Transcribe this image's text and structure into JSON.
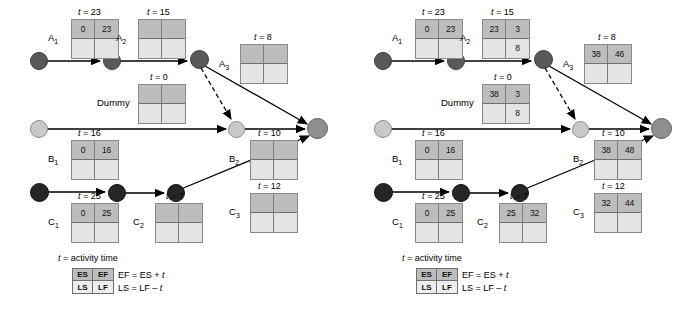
{
  "figure": {
    "type": "project-network-diagram",
    "panels": [
      {
        "id": "left",
        "caption": "",
        "nodes": [
          {
            "name": "node-a-start",
            "shade": "dark",
            "x": 30,
            "y": 52,
            "d": 18
          },
          {
            "name": "node-a-1",
            "shade": "dark",
            "x": 103,
            "y": 52,
            "d": 18
          },
          {
            "name": "node-a-2",
            "shade": "dark",
            "x": 190,
            "y": 50,
            "d": 19
          },
          {
            "name": "node-b-start",
            "shade": "light",
            "x": 30,
            "y": 120,
            "d": 18
          },
          {
            "name": "node-b-1",
            "shade": "light",
            "x": 228,
            "y": 121,
            "d": 17
          },
          {
            "name": "node-c-start",
            "shade": "black",
            "x": 30,
            "y": 183,
            "d": 19
          },
          {
            "name": "node-c-1",
            "shade": "black",
            "x": 108,
            "y": 184,
            "d": 18
          },
          {
            "name": "node-c-2",
            "shade": "black",
            "x": 167,
            "y": 184,
            "d": 18
          },
          {
            "name": "node-finish",
            "shade": "mid",
            "x": 307,
            "y": 118,
            "d": 21
          }
        ],
        "activities": [
          {
            "name": "activity-a1",
            "label": "A",
            "sub": "1",
            "t_prefix": "t =",
            "t": "23",
            "box": {
              "x": 71,
              "y": 19,
              "w": 48,
              "h": 40
            },
            "t_pos": {
              "x": 78,
              "y": 7
            },
            "label_pos": {
              "x": 48,
              "y": 32
            },
            "cells": [
              "0",
              "23",
              "",
              ""
            ]
          },
          {
            "name": "activity-a2",
            "label": "A",
            "sub": "2",
            "t_prefix": "t =",
            "t": "15",
            "box": {
              "x": 138,
              "y": 19,
              "w": 48,
              "h": 40
            },
            "t_pos": {
              "x": 147,
              "y": 7
            },
            "label_pos": {
              "x": 116,
              "y": 32
            },
            "cells": [
              "",
              "",
              "",
              ""
            ]
          },
          {
            "name": "activity-a3",
            "label": "A",
            "sub": "3",
            "t_prefix": "t =",
            "t": "8",
            "box": {
              "x": 240,
              "y": 44,
              "w": 48,
              "h": 40
            },
            "t_pos": {
              "x": 254,
              "y": 32
            },
            "label_pos": {
              "x": 219,
              "y": 58
            },
            "cells": [
              "",
              "",
              "",
              ""
            ]
          },
          {
            "name": "activity-dummy",
            "label": "Dummy",
            "sub": "",
            "t_prefix": "t =",
            "t": "0",
            "box": {
              "x": 138,
              "y": 84,
              "w": 48,
              "h": 40
            },
            "t_pos": {
              "x": 150,
              "y": 72
            },
            "label_pos": {
              "x": 97,
              "y": 97
            },
            "cells": [
              "",
              "",
              "",
              ""
            ]
          },
          {
            "name": "activity-b1",
            "label": "B",
            "sub": "1",
            "t_prefix": "t =",
            "t": "16",
            "box": {
              "x": 71,
              "y": 140,
              "w": 48,
              "h": 40
            },
            "t_pos": {
              "x": 78,
              "y": 128
            },
            "label_pos": {
              "x": 48,
              "y": 153
            },
            "cells": [
              "0",
              "16",
              "",
              ""
            ]
          },
          {
            "name": "activity-b2",
            "label": "B",
            "sub": "2",
            "t_prefix": "t =",
            "t": "10",
            "box": {
              "x": 250,
              "y": 140,
              "w": 48,
              "h": 40
            },
            "t_pos": {
              "x": 258,
              "y": 128
            },
            "label_pos": {
              "x": 229,
              "y": 153
            },
            "cells": [
              "",
              "",
              "",
              ""
            ]
          },
          {
            "name": "activity-c1",
            "label": "C",
            "sub": "1",
            "t_prefix": "t =",
            "t": "25",
            "box": {
              "x": 71,
              "y": 203,
              "w": 48,
              "h": 40
            },
            "t_pos": {
              "x": 78,
              "y": 191
            },
            "label_pos": {
              "x": 48,
              "y": 216
            },
            "cells": [
              "0",
              "25",
              "",
              ""
            ]
          },
          {
            "name": "activity-c2",
            "label": "C",
            "sub": "2",
            "t_prefix": "t =",
            "t": "7",
            "box": {
              "x": 155,
              "y": 203,
              "w": 48,
              "h": 40
            },
            "t_pos": {
              "x": 166,
              "y": 191
            },
            "label_pos": {
              "x": 133,
              "y": 216
            },
            "cells": [
              "",
              "",
              "",
              ""
            ]
          },
          {
            "name": "activity-c3",
            "label": "C",
            "sub": "3",
            "t_prefix": "t =",
            "t": "12",
            "box": {
              "x": 250,
              "y": 193,
              "w": 48,
              "h": 40
            },
            "t_pos": {
              "x": 258,
              "y": 181
            },
            "label_pos": {
              "x": 229,
              "y": 206
            },
            "cells": [
              "",
              "",
              "",
              ""
            ]
          }
        ],
        "legend": {
          "x": 58,
          "y": 253,
          "title_prefix": "t",
          "title_rest": "= activity time",
          "cells": [
            "ES",
            "EF",
            "LS",
            "LF"
          ],
          "eq_top": "EF = ES +",
          "eq_top_var": "t",
          "eq_bottom": "LS = LF –",
          "eq_bottom_var": "t"
        }
      },
      {
        "id": "right",
        "caption": "",
        "nodes": [
          {
            "name": "node-a-start",
            "shade": "dark",
            "x": 30,
            "y": 52,
            "d": 18
          },
          {
            "name": "node-a-1",
            "shade": "dark",
            "x": 103,
            "y": 52,
            "d": 18
          },
          {
            "name": "node-a-2",
            "shade": "dark",
            "x": 190,
            "y": 50,
            "d": 19
          },
          {
            "name": "node-b-start",
            "shade": "light",
            "x": 30,
            "y": 120,
            "d": 18
          },
          {
            "name": "node-b-1",
            "shade": "light",
            "x": 228,
            "y": 121,
            "d": 17
          },
          {
            "name": "node-c-start",
            "shade": "black",
            "x": 30,
            "y": 183,
            "d": 19
          },
          {
            "name": "node-c-1",
            "shade": "black",
            "x": 108,
            "y": 184,
            "d": 18
          },
          {
            "name": "node-c-2",
            "shade": "black",
            "x": 167,
            "y": 184,
            "d": 18
          },
          {
            "name": "node-finish",
            "shade": "mid",
            "x": 307,
            "y": 118,
            "d": 21
          }
        ],
        "activities": [
          {
            "name": "activity-a1",
            "label": "A",
            "sub": "1",
            "t_prefix": "t =",
            "t": "23",
            "box": {
              "x": 71,
              "y": 19,
              "w": 48,
              "h": 40
            },
            "t_pos": {
              "x": 78,
              "y": 7
            },
            "label_pos": {
              "x": 48,
              "y": 32
            },
            "cells": [
              "0",
              "23",
              "",
              ""
            ]
          },
          {
            "name": "activity-a2",
            "label": "A",
            "sub": "2",
            "t_prefix": "t =",
            "t": "15",
            "box": {
              "x": 138,
              "y": 19,
              "w": 48,
              "h": 40
            },
            "t_pos": {
              "x": 147,
              "y": 7
            },
            "label_pos": {
              "x": 116,
              "y": 32
            },
            "cells": [
              "23",
              "3",
              "",
              "8"
            ]
          },
          {
            "name": "activity-a3",
            "label": "A",
            "sub": "3",
            "t_prefix": "t =",
            "t": "8",
            "box": {
              "x": 240,
              "y": 44,
              "w": 48,
              "h": 40
            },
            "t_pos": {
              "x": 254,
              "y": 32
            },
            "label_pos": {
              "x": 219,
              "y": 58
            },
            "cells": [
              "38",
              "46",
              "",
              ""
            ]
          },
          {
            "name": "activity-dummy",
            "label": "Dummy",
            "sub": "",
            "t_prefix": "t =",
            "t": "0",
            "box": {
              "x": 138,
              "y": 84,
              "w": 48,
              "h": 40
            },
            "t_pos": {
              "x": 150,
              "y": 72
            },
            "label_pos": {
              "x": 97,
              "y": 97
            },
            "cells": [
              "38",
              "3",
              "",
              "8"
            ]
          },
          {
            "name": "activity-b1",
            "label": "B",
            "sub": "1",
            "t_prefix": "t =",
            "t": "16",
            "box": {
              "x": 71,
              "y": 140,
              "w": 48,
              "h": 40
            },
            "t_pos": {
              "x": 78,
              "y": 128
            },
            "label_pos": {
              "x": 48,
              "y": 153
            },
            "cells": [
              "0",
              "16",
              "",
              ""
            ]
          },
          {
            "name": "activity-b2",
            "label": "B",
            "sub": "2",
            "t_prefix": "t =",
            "t": "10",
            "box": {
              "x": 250,
              "y": 140,
              "w": 48,
              "h": 40
            },
            "t_pos": {
              "x": 258,
              "y": 128
            },
            "label_pos": {
              "x": 229,
              "y": 153
            },
            "cells": [
              "38",
              "48",
              "",
              ""
            ]
          },
          {
            "name": "activity-c1",
            "label": "C",
            "sub": "1",
            "t_prefix": "t =",
            "t": "25",
            "box": {
              "x": 71,
              "y": 203,
              "w": 48,
              "h": 40
            },
            "t_pos": {
              "x": 78,
              "y": 191
            },
            "label_pos": {
              "x": 48,
              "y": 216
            },
            "cells": [
              "0",
              "25",
              "",
              ""
            ]
          },
          {
            "name": "activity-c2",
            "label": "C",
            "sub": "2",
            "t_prefix": "t =",
            "t": "7",
            "box": {
              "x": 155,
              "y": 203,
              "w": 48,
              "h": 40
            },
            "t_pos": {
              "x": 166,
              "y": 191
            },
            "label_pos": {
              "x": 133,
              "y": 216
            },
            "cells": [
              "25",
              "32",
              "",
              ""
            ]
          },
          {
            "name": "activity-c3",
            "label": "C",
            "sub": "3",
            "t_prefix": "t =",
            "t": "12",
            "box": {
              "x": 250,
              "y": 193,
              "w": 48,
              "h": 40
            },
            "t_pos": {
              "x": 258,
              "y": 181
            },
            "label_pos": {
              "x": 229,
              "y": 206
            },
            "cells": [
              "32",
              "44",
              "",
              ""
            ]
          }
        ],
        "legend": {
          "x": 58,
          "y": 253,
          "title_prefix": "t",
          "title_rest": "= activity time",
          "cells": [
            "ES",
            "EF",
            "LS",
            "LF"
          ],
          "eq_top": "EF = ES +",
          "eq_top_var": "t",
          "eq_bottom": "LS = LF –",
          "eq_bottom_var": "t"
        }
      }
    ],
    "edges": [
      {
        "name": "edge-a-start-a1",
        "x1": 39,
        "y1": 61,
        "x2": 100,
        "y2": 61,
        "dashed": false
      },
      {
        "name": "edge-a1-a2",
        "x1": 112,
        "y1": 61,
        "x2": 187,
        "y2": 61,
        "dashed": false
      },
      {
        "name": "edge-a2-finish",
        "x1": 205,
        "y1": 66,
        "x2": 307,
        "y2": 124,
        "dashed": false
      },
      {
        "name": "edge-a2-b1-dummy",
        "x1": 201,
        "y1": 68,
        "x2": 231,
        "y2": 119,
        "dashed": true
      },
      {
        "name": "edge-b-start-b1",
        "x1": 39,
        "y1": 129,
        "x2": 226,
        "y2": 129,
        "dashed": false
      },
      {
        "name": "edge-b1-finish",
        "x1": 245,
        "y1": 129,
        "x2": 305,
        "y2": 129,
        "dashed": false
      },
      {
        "name": "edge-c-start-c1",
        "x1": 40,
        "y1": 192,
        "x2": 105,
        "y2": 192,
        "dashed": false
      },
      {
        "name": "edge-c1-c2",
        "x1": 117,
        "y1": 193,
        "x2": 164,
        "y2": 193,
        "dashed": false
      },
      {
        "name": "edge-c2-finish",
        "x1": 181,
        "y1": 189,
        "x2": 309,
        "y2": 136,
        "dashed": false
      }
    ],
    "colors": {
      "node_dark": "#595959",
      "node_black": "#262626",
      "node_light": "#c9c9c9",
      "node_mid": "#8f8f8f",
      "box_top_fill": "#bdbdbd",
      "box_bottom_fill": "#e4e4e4",
      "box_border": "#8a8a8a",
      "edge": "#000000",
      "background": "#ffffff"
    }
  }
}
